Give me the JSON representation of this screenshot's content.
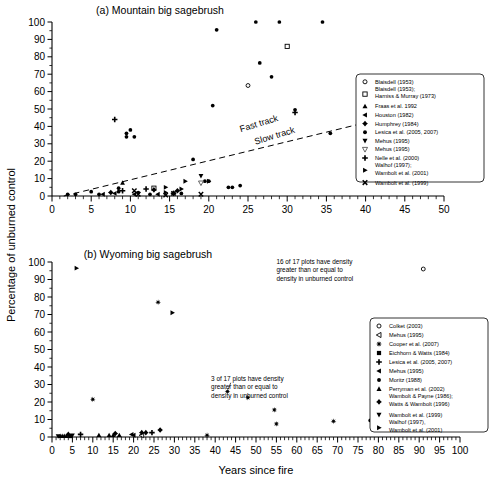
{
  "figure": {
    "axis_label_y": "Percentage of unburned control",
    "axis_label_x": "Years since fire"
  },
  "chart_data": [
    {
      "type": "scatter",
      "panel": "a",
      "title": "(a) Mountain big sagebrush",
      "xlabel": "",
      "ylabel": "Percentage of unburned control",
      "xlim": [
        0,
        50
      ],
      "ylim": [
        0,
        100
      ],
      "xticks": [
        0,
        5,
        10,
        15,
        20,
        25,
        30,
        35,
        40,
        45,
        50
      ],
      "yticks": [
        0,
        10,
        20,
        30,
        40,
        50,
        60,
        70,
        80,
        90,
        100
      ],
      "xminor_step": 1,
      "grid": false,
      "annotations": [
        {
          "text": "Fast track",
          "x": 26.5,
          "y": 40
        },
        {
          "text": "Slow track",
          "x": 28.5,
          "y": 33
        }
      ],
      "reference_line": {
        "style": "dashed",
        "x0": 1.5,
        "y0": 0,
        "x1": 43.5,
        "y1": 46
      },
      "legend_position": "right",
      "series": [
        {
          "name": "Blaisdell (1953)",
          "marker": "open-circle",
          "points": [
            [
              25.0,
              63.5
            ]
          ]
        },
        {
          "name": "Blaisdell (1953); Harniss & Murray (1973)",
          "marker": "open-square",
          "points": [
            [
              13.0,
              4.5
            ],
            [
              30.0,
              86.0
            ]
          ]
        },
        {
          "name": "Fraas et al. 1992",
          "marker": "triangle-up",
          "points": [
            [
              9.0,
              7.5
            ]
          ]
        },
        {
          "name": "Houston (1982)",
          "marker": "triangle-left",
          "points": [
            [
              6.5,
              1.0
            ],
            [
              8.0,
              1.5
            ],
            [
              10.5,
              1.0
            ],
            [
              13.5,
              1.0
            ]
          ]
        },
        {
          "name": "Humphrey (1984)",
          "marker": "diamond-plus",
          "points": [
            [
              7.5,
              2.0
            ],
            [
              13.0,
              3.5
            ],
            [
              15.5,
              1.5
            ],
            [
              16.0,
              3.0
            ]
          ]
        },
        {
          "name": "Lesica et al. (2005, 2007)",
          "marker": "filled-circle",
          "points": [
            [
              2.0,
              1.0
            ],
            [
              3.0,
              1.0
            ],
            [
              5.0,
              2.5
            ],
            [
              6.0,
              1.0
            ],
            [
              8.5,
              2.5
            ],
            [
              8.5,
              4.5
            ],
            [
              9.5,
              34.0
            ],
            [
              9.5,
              36.0
            ],
            [
              10.0,
              38.0
            ],
            [
              10.5,
              34.0
            ],
            [
              11.0,
              2.0
            ],
            [
              12.5,
              1.0
            ],
            [
              16.5,
              1.5
            ],
            [
              18.0,
              21.0
            ],
            [
              19.5,
              8.5
            ],
            [
              20.0,
              8.5
            ],
            [
              20.5,
              52.0
            ],
            [
              21.0,
              95.5
            ],
            [
              22.5,
              5.0
            ],
            [
              23.0,
              5.0
            ],
            [
              24.0,
              6.0
            ],
            [
              26.0,
              100.0
            ],
            [
              26.5,
              76.5
            ],
            [
              28.0,
              68.5
            ],
            [
              29.0,
              100.0
            ],
            [
              31.0,
              49.5
            ],
            [
              34.5,
              100.0
            ],
            [
              35.5,
              36.0
            ]
          ]
        },
        {
          "name": "Mehus (1995)",
          "marker": "triangle-down-filled",
          "points": [
            [
              19.0,
              11.5
            ]
          ]
        },
        {
          "name": "Mehus (1995)",
          "marker": "triangle-down-open",
          "points": [
            [
              19.0,
              7.5
            ]
          ]
        },
        {
          "name": "Nelle et al. (2000)",
          "marker": "plus",
          "points": [
            [
              8.0,
              44.0
            ],
            [
              9.0,
              3.0
            ],
            [
              12.0,
              4.0
            ],
            [
              15.5,
              1.5
            ],
            [
              31.0,
              48.0
            ]
          ]
        },
        {
          "name": "Walhof (1997); Wambolt et al. (2001)",
          "marker": "triangle-right",
          "points": [
            [
              14.5,
              2.0
            ],
            [
              14.5,
              5.0
            ],
            [
              16.5,
              4.0
            ],
            [
              17.0,
              8.5
            ],
            [
              20.0,
              8.5
            ]
          ]
        },
        {
          "name": "Wambolt et al. (1999)",
          "marker": "x-cross",
          "points": [
            [
              10.5,
              3.0
            ],
            [
              11.0,
              1.0
            ],
            [
              14.5,
              0.5
            ],
            [
              15.5,
              1.5
            ],
            [
              19.0,
              1.0
            ]
          ]
        }
      ]
    },
    {
      "type": "scatter",
      "panel": "b",
      "title": "(b) Wyoming big sagebrush",
      "xlabel": "Years since fire",
      "ylabel": "Percentage of unburned control",
      "xlim": [
        0,
        100
      ],
      "ylim": [
        0,
        100
      ],
      "xticks": [
        0,
        5,
        10,
        15,
        20,
        25,
        30,
        35,
        40,
        45,
        50,
        55,
        60,
        65,
        70,
        75,
        80,
        85,
        90,
        95,
        100
      ],
      "yticks": [
        0,
        10,
        20,
        30,
        40,
        50,
        60,
        70,
        80,
        90,
        100
      ],
      "xminor_step": 1,
      "grid": false,
      "annotations": [
        {
          "text": "16 of 17 plots have density\ngreater than or equal to\ndensity in unburned control",
          "x": 58,
          "y": 96
        },
        {
          "text": "3 of 17 plots have density\ngreater than or equal to\ndensity in unburned control",
          "x": 42,
          "y": 29
        }
      ],
      "legend_position": "right",
      "series": [
        {
          "name": "Colket (2003)",
          "marker": "open-circle",
          "points": [
            [
              91.0,
              96.0
            ]
          ]
        },
        {
          "name": "Mehus (1995)",
          "marker": "triangle-left-open",
          "points": [
            [
              22.0,
              1.0
            ]
          ]
        },
        {
          "name": "Cooper et al. (2007)",
          "marker": "star-burst",
          "points": [
            [
              10.0,
              21.5
            ],
            [
              26.0,
              77.0
            ],
            [
              38.0,
              1.0
            ],
            [
              43.0,
              26.0
            ],
            [
              48.0,
              22.5
            ],
            [
              54.5,
              15.5
            ],
            [
              55.0,
              7.5
            ],
            [
              69.0,
              9.0
            ]
          ]
        },
        {
          "name": "Eichhorn & Watts (1984)",
          "marker": "filled-square",
          "points": [
            [
              4.5,
              0.5
            ]
          ]
        },
        {
          "name": "Lesica et al. (2005, 2007)",
          "marker": "plus",
          "points": [
            [
              7.0,
              1.5
            ],
            [
              24.5,
              2.5
            ]
          ]
        },
        {
          "name": "Mehus (1995)",
          "marker": "triangle-left",
          "points": [
            [
              19.5,
              1.5
            ],
            [
              20.0,
              1.0
            ]
          ]
        },
        {
          "name": "Moritz (1988)",
          "marker": "filled-circle",
          "points": [
            [
              78.0,
              9.5
            ]
          ]
        },
        {
          "name": "Perryman et al. (2002)",
          "marker": "triangle-up",
          "points": [
            [
              2.0,
              0.5
            ],
            [
              2.5,
              0.5
            ],
            [
              3.0,
              0.5
            ],
            [
              3.5,
              0.5
            ],
            [
              11.5,
              1.0
            ],
            [
              14.0,
              1.0
            ],
            [
              15.0,
              1.0
            ],
            [
              16.5,
              1.0
            ]
          ]
        },
        {
          "name": "Wambolt & Payne (1986); Watts & Wambolt (1996)",
          "marker": "diamond-plus",
          "points": [
            [
              4.0,
              1.5
            ],
            [
              15.5,
              2.0
            ],
            [
              22.0,
              2.5
            ],
            [
              23.0,
              2.5
            ],
            [
              26.5,
              4.0
            ]
          ]
        },
        {
          "name": "Wambolt et al. (1999)",
          "marker": "triangle-down-filled",
          "points": [
            [
              1.5,
              0.5
            ],
            [
              5.0,
              1.0
            ]
          ]
        },
        {
          "name": "Walhof (1997); Wambolt et al. (2001)",
          "marker": "triangle-right",
          "points": [
            [
              6.0,
              96.5
            ],
            [
              29.5,
              71.0
            ]
          ]
        }
      ]
    }
  ],
  "panel_a": {
    "title": "(a) Mountain big sagebrush",
    "track_fast": "Fast track",
    "track_slow": "Slow track",
    "legend": [
      {
        "marker": "open-circle",
        "label": "Blaisdell (1953)"
      },
      {
        "marker": "open-square",
        "label": "Blaisdell (1953);",
        "label2": "Harniss & Murray (1973)"
      },
      {
        "marker": "triangle-up",
        "label": "Fraas et al. 1992"
      },
      {
        "marker": "triangle-left",
        "label": "Houston (1982)"
      },
      {
        "marker": "diamond-plus",
        "label": "Humphrey (1984)"
      },
      {
        "marker": "filled-circle",
        "label": "Lesica et al. (2005, 2007)"
      },
      {
        "marker": "triangle-down-filled",
        "label": "Mehus (1995)"
      },
      {
        "marker": "triangle-down-open",
        "label": "Mehus (1995)"
      },
      {
        "marker": "plus",
        "label": "Nelle et al. (2000)"
      },
      {
        "marker": "triangle-right",
        "label": "Walhof (1997);",
        "label2": "Wambolt et al. (2001)"
      },
      {
        "marker": "x-cross",
        "label": "Wambolt et al. (1999)"
      }
    ]
  },
  "panel_b": {
    "title": "(b) Wyoming big sagebrush",
    "note_top": "16 of 17 plots have density greater than or equal to density in unburned control",
    "note_top_lines": [
      "16 of 17 plots have density",
      "greater than or equal to",
      "density in unburned control"
    ],
    "note_mid": "3 of 17 plots have density greater than or equal to density in unburned control",
    "note_mid_lines": [
      "3 of 17 plots have density",
      "greater than or equal to",
      "density in unburned control"
    ],
    "legend": [
      {
        "marker": "open-circle",
        "label": "Colket (2003)"
      },
      {
        "marker": "triangle-left-open",
        "label": "Mehus (1995)"
      },
      {
        "marker": "star-burst",
        "label": "Cooper et al. (2007)"
      },
      {
        "marker": "filled-square",
        "label": "Eichhorn & Watts (1984)"
      },
      {
        "marker": "plus",
        "label": "Lesica et al. (2005, 2007)"
      },
      {
        "marker": "triangle-left",
        "label": "Mehus (1995)"
      },
      {
        "marker": "filled-circle",
        "label": "Moritz (1988)"
      },
      {
        "marker": "triangle-up",
        "label": "Perryman et al. (2002)"
      },
      {
        "marker": "diamond-plus",
        "label": "Wambolt & Payne (1986);",
        "label2": "Watts & Wambolt (1996)"
      },
      {
        "marker": "triangle-down-filled",
        "label": "Wambolt et al. (1999)"
      },
      {
        "marker": "triangle-right",
        "label": "Walhof (1997),",
        "label2": "Wambolt et al. (2001)"
      }
    ]
  },
  "colors": {
    "ink": "#000000",
    "paper": "#ffffff"
  }
}
